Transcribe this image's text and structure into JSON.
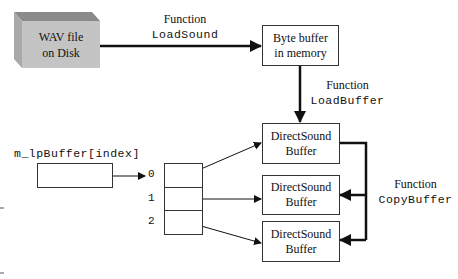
{
  "diagram": {
    "wav_disk": {
      "line1": "WAV file",
      "line2": "on Disk"
    },
    "load_sound": {
      "label": "Function",
      "func": "LoadSound"
    },
    "byte_buffer": {
      "line1": "Byte buffer",
      "line2": "in memory"
    },
    "load_buffer": {
      "label": "Function",
      "func": "LoadBuffer"
    },
    "pointer": {
      "label": "m_lpBuffer[index]"
    },
    "array_indices": [
      "0",
      "1",
      "2"
    ],
    "ds_buffers": [
      {
        "line1": "DirectSound",
        "line2": "Buffer"
      },
      {
        "line1": "DirectSound",
        "line2": "Buffer"
      },
      {
        "line1": "DirectSound",
        "line2": "Buffer"
      }
    ],
    "copy_buffer": {
      "label": "Function",
      "func": "CopyBuffer"
    }
  }
}
